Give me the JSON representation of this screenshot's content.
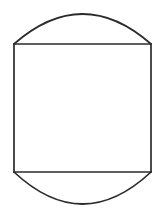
{
  "canvas": {
    "width": 166,
    "height": 218,
    "background_color": "#ffffff"
  },
  "figure": {
    "name": "rectangle-with-circular-arc-caps",
    "fill": "none",
    "stroke_color": "#2b2b2b",
    "stroke_width": 1.7,
    "rectangle": {
      "left": 14,
      "right": 151,
      "top": 44,
      "bottom": 172,
      "width": 137,
      "height": 128
    },
    "top_arc": {
      "start_x": 14,
      "start_y": 44,
      "end_x": 151,
      "end_y": 44,
      "apex_x": 82.5,
      "apex_y": 14,
      "bulge_height": 30,
      "direction": "up"
    },
    "bottom_arc": {
      "start_x": 14,
      "start_y": 172,
      "end_x": 151,
      "end_y": 172,
      "apex_x": 82.5,
      "apex_y": 204,
      "bulge_height": 32,
      "direction": "down"
    },
    "paths": {
      "top_arc_d": "M 14 44 Q 82.5 -16 151 44",
      "right_side_d": "M 151 44 L 151 172",
      "bottom_arc_d": "M 151 172 Q 82.5 236 14 172",
      "left_side_d": "M 14 172 L 14 44",
      "outline_d": "M 14 44 Q 82.5 -16 151 44 L 151 172 Q 82.5 236 14 172 Z"
    }
  }
}
